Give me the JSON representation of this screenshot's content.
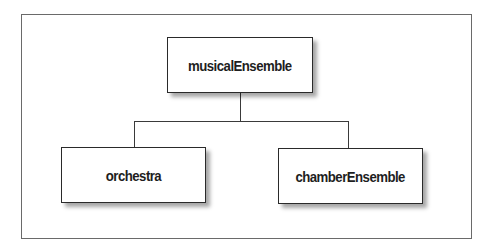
{
  "diagram": {
    "type": "tree",
    "root": {
      "id": "musicalEnsemble",
      "label": "musicalEnsemble"
    },
    "children": [
      {
        "id": "orchestra",
        "label": "orchestra",
        "parent": "musicalEnsemble"
      },
      {
        "id": "chamberEnsemble",
        "label": "chamberEnsemble",
        "parent": "musicalEnsemble"
      }
    ],
    "edges": [
      {
        "from": "musicalEnsemble",
        "to": "orchestra"
      },
      {
        "from": "musicalEnsemble",
        "to": "chamberEnsemble"
      }
    ]
  },
  "colors": {
    "background": "#ffffff",
    "frame_border": "#6a6a6a",
    "node_border": "#2a2a2a",
    "connector": "#3a3a3a",
    "text": "#1e1e1e"
  }
}
